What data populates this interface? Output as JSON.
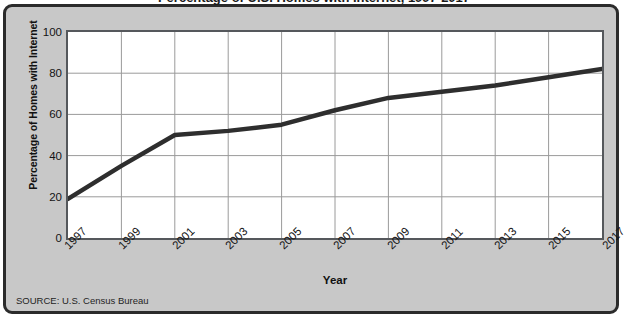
{
  "figure": {
    "title": "Percentage of U.S. Homes with Internet, 1997-2017",
    "source": "SOURCE: U.S. Census Bureau",
    "frame_color": "#2b2b2b",
    "background_color": "#c8c8c8",
    "plot_background_color": "#ffffff",
    "line_color": "#2e2e2e",
    "grid_color": "#9a9a9a"
  },
  "chart_data": {
    "type": "line",
    "title": "Percentage of U.S. Homes with Internet, 1997-2017",
    "xlabel": "Year",
    "ylabel": "Percentage of Homes with Internet",
    "xlim": [
      1997,
      2017
    ],
    "ylim": [
      0,
      100
    ],
    "grid": true,
    "legend": "none",
    "y_ticks": [
      0,
      20,
      40,
      60,
      80,
      100
    ],
    "x_ticks": [
      1997,
      1999,
      2001,
      2003,
      2005,
      2007,
      2009,
      2011,
      2013,
      2015,
      2017
    ],
    "x": [
      1997,
      1999,
      2001,
      2003,
      2005,
      2007,
      2009,
      2011,
      2013,
      2015,
      2017
    ],
    "values": [
      19,
      35,
      50,
      52,
      55,
      62,
      68,
      71,
      74,
      78,
      82
    ],
    "series": [
      {
        "name": "Percentage of Homes with Internet",
        "values": [
          19,
          35,
          50,
          52,
          55,
          62,
          68,
          71,
          74,
          78,
          82
        ]
      }
    ]
  }
}
